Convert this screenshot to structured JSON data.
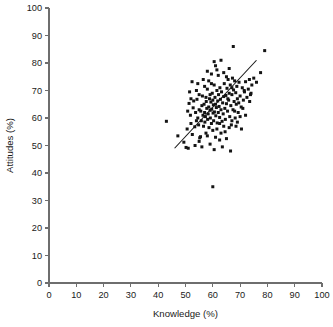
{
  "chart_data": {
    "type": "scatter",
    "title": "",
    "subtitle": "",
    "xlabel": "Knowledge (%)",
    "ylabel": "Attitudes (%)",
    "xlim": [
      0,
      100
    ],
    "ylim": [
      0,
      100
    ],
    "xticks": [
      0,
      10,
      20,
      30,
      40,
      50,
      60,
      70,
      80,
      90,
      100
    ],
    "yticks": [
      0,
      10,
      20,
      30,
      40,
      50,
      60,
      70,
      80,
      90,
      100
    ],
    "xtick_labels": [
      "0",
      "10",
      "20",
      "30",
      "40",
      "50",
      "60",
      "70",
      "80",
      "90",
      "100"
    ],
    "ytick_labels": [
      "0",
      "10",
      "20",
      "30",
      "40",
      "50",
      "60",
      "70",
      "80",
      "90",
      "100"
    ],
    "grid": false,
    "legend": false,
    "legend_position": "none",
    "marker": "square",
    "marker_color": "#141414",
    "marker_size_px": 3,
    "annotations": [],
    "trendline": {
      "type": "linear-fit",
      "x_start": 46.0,
      "y_start": 49.0,
      "x_end": 76.0,
      "y_end": 81.0,
      "color": "#141414"
    },
    "series": [
      {
        "name": "Respondents",
        "points": [
          [
            43.0,
            58.8
          ],
          [
            47.2,
            53.5
          ],
          [
            49.4,
            51.2
          ],
          [
            50.2,
            49.3
          ],
          [
            51.0,
            49.0
          ],
          [
            50.6,
            56.0
          ],
          [
            51.3,
            65.3
          ],
          [
            51.8,
            61.0
          ],
          [
            52.0,
            58.0
          ],
          [
            52.4,
            73.2
          ],
          [
            52.8,
            63.7
          ],
          [
            53.0,
            66.2
          ],
          [
            53.4,
            56.8
          ],
          [
            53.7,
            62.0
          ],
          [
            54.0,
            70.0
          ],
          [
            54.2,
            66.8
          ],
          [
            54.5,
            60.0
          ],
          [
            54.8,
            57.5
          ],
          [
            55.0,
            63.0
          ],
          [
            55.2,
            52.8
          ],
          [
            55.5,
            53.2
          ],
          [
            55.6,
            62.5
          ],
          [
            55.8,
            59.0
          ],
          [
            56.0,
            64.5
          ],
          [
            56.2,
            68.0
          ],
          [
            56.4,
            61.0
          ],
          [
            56.6,
            57.0
          ],
          [
            56.8,
            65.0
          ],
          [
            57.0,
            62.0
          ],
          [
            57.1,
            58.5
          ],
          [
            57.3,
            60.5
          ],
          [
            57.5,
            54.5
          ],
          [
            57.6,
            66.0
          ],
          [
            57.8,
            63.5
          ],
          [
            58.0,
            70.5
          ],
          [
            58.1,
            59.5
          ],
          [
            58.3,
            61.5
          ],
          [
            58.5,
            64.0
          ],
          [
            58.6,
            56.5
          ],
          [
            58.8,
            67.0
          ],
          [
            59.0,
            62.8
          ],
          [
            59.1,
            60.0
          ],
          [
            59.3,
            65.8
          ],
          [
            59.5,
            58.0
          ],
          [
            59.6,
            63.2
          ],
          [
            59.8,
            69.0
          ],
          [
            60.0,
            66.5
          ],
          [
            60.1,
            61.8
          ],
          [
            60.2,
            64.8
          ],
          [
            60.3,
            59.0
          ],
          [
            60.5,
            72.0
          ],
          [
            60.6,
            62.2
          ],
          [
            60.8,
            67.5
          ],
          [
            61.0,
            65.0
          ],
          [
            61.1,
            60.8
          ],
          [
            61.3,
            63.8
          ],
          [
            61.5,
            70.0
          ],
          [
            61.6,
            58.2
          ],
          [
            61.8,
            66.2
          ],
          [
            62.0,
            62.0
          ],
          [
            62.1,
            68.5
          ],
          [
            62.3,
            64.2
          ],
          [
            62.5,
            60.2
          ],
          [
            62.6,
            71.0
          ],
          [
            62.8,
            66.8
          ],
          [
            63.0,
            63.0
          ],
          [
            63.2,
            69.5
          ],
          [
            63.4,
            58.8
          ],
          [
            63.6,
            65.5
          ],
          [
            63.8,
            61.5
          ],
          [
            64.0,
            67.8
          ],
          [
            64.2,
            72.5
          ],
          [
            64.4,
            63.5
          ],
          [
            64.6,
            59.5
          ],
          [
            64.8,
            68.2
          ],
          [
            65.0,
            65.2
          ],
          [
            65.2,
            70.8
          ],
          [
            65.4,
            62.5
          ],
          [
            65.6,
            74.0
          ],
          [
            65.8,
            66.5
          ],
          [
            66.0,
            69.0
          ],
          [
            66.2,
            60.5
          ],
          [
            66.4,
            72.0
          ],
          [
            66.6,
            64.5
          ],
          [
            66.8,
            57.5
          ],
          [
            67.0,
            68.5
          ],
          [
            67.2,
            74.5
          ],
          [
            67.4,
            63.0
          ],
          [
            67.6,
            70.2
          ],
          [
            67.8,
            66.0
          ],
          [
            68.0,
            73.5
          ],
          [
            68.2,
            60.0
          ],
          [
            68.4,
            69.2
          ],
          [
            68.6,
            65.0
          ],
          [
            68.8,
            71.5
          ],
          [
            69.0,
            67.0
          ],
          [
            69.3,
            62.0
          ],
          [
            69.6,
            73.0
          ],
          [
            70.0,
            68.0
          ],
          [
            70.4,
            64.0
          ],
          [
            70.8,
            71.0
          ],
          [
            71.2,
            66.5
          ],
          [
            71.6,
            69.5
          ],
          [
            72.0,
            73.2
          ],
          [
            72.5,
            67.5
          ],
          [
            73.0,
            70.5
          ],
          [
            73.4,
            74.0
          ],
          [
            73.8,
            68.5
          ],
          [
            74.3,
            72.0
          ],
          [
            75.0,
            74.5
          ],
          [
            76.0,
            73.0
          ],
          [
            77.5,
            76.5
          ],
          [
            79.0,
            84.5
          ],
          [
            67.5,
            86.0
          ],
          [
            60.5,
            80.5
          ],
          [
            61.0,
            79.0
          ],
          [
            61.5,
            77.5
          ],
          [
            63.0,
            81.0
          ],
          [
            62.0,
            75.5
          ],
          [
            64.0,
            76.5
          ],
          [
            65.0,
            75.0
          ],
          [
            66.0,
            78.0
          ],
          [
            59.5,
            76.0
          ],
          [
            58.5,
            73.5
          ],
          [
            57.0,
            71.5
          ],
          [
            59.0,
            68.5
          ],
          [
            60.0,
            55.5
          ],
          [
            61.0,
            53.0
          ],
          [
            59.0,
            50.5
          ],
          [
            60.5,
            48.5
          ],
          [
            62.5,
            52.0
          ],
          [
            63.5,
            49.5
          ],
          [
            65.0,
            52.5
          ],
          [
            66.5,
            48.0
          ],
          [
            64.5,
            55.0
          ],
          [
            66.0,
            56.5
          ],
          [
            67.0,
            59.0
          ],
          [
            68.5,
            57.0
          ],
          [
            70.0,
            60.5
          ],
          [
            71.0,
            63.5
          ],
          [
            72.0,
            61.0
          ],
          [
            73.5,
            66.0
          ],
          [
            60.0,
            35.0
          ],
          [
            55.0,
            51.5
          ],
          [
            53.5,
            50.0
          ],
          [
            52.5,
            54.0
          ],
          [
            50.8,
            62.5
          ],
          [
            51.5,
            69.5
          ],
          [
            54.5,
            72.5
          ],
          [
            56.5,
            74.0
          ],
          [
            58.0,
            77.0
          ],
          [
            62.5,
            58.0
          ],
          [
            64.0,
            57.0
          ],
          [
            61.5,
            56.0
          ],
          [
            63.0,
            54.5
          ],
          [
            68.0,
            62.5
          ],
          [
            69.0,
            58.5
          ],
          [
            70.5,
            56.0
          ],
          [
            71.5,
            70.0
          ],
          [
            74.0,
            69.0
          ],
          [
            56.0,
            49.5
          ],
          [
            57.5,
            67.5
          ],
          [
            54.0,
            59.0
          ],
          [
            52.0,
            67.0
          ],
          [
            59.5,
            72.5
          ],
          [
            65.5,
            67.0
          ],
          [
            67.0,
            71.0
          ],
          [
            69.5,
            65.5
          ],
          [
            55.0,
            68.5
          ],
          [
            58.0,
            53.5
          ]
        ]
      }
    ]
  },
  "axes": {
    "x_title": "Knowledge (%)",
    "y_title": "Attitudes (%)"
  }
}
